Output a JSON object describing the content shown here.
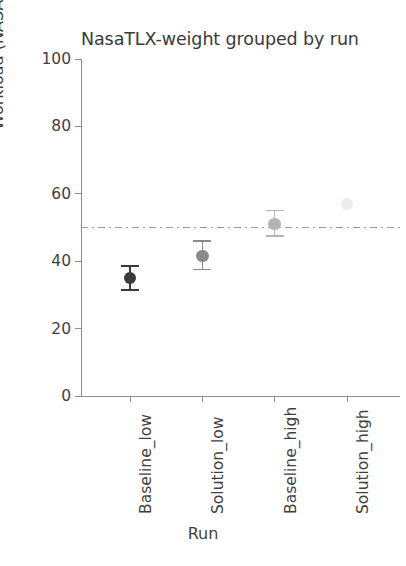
{
  "chart_data": {
    "type": "scatter",
    "title": "NasaTLX-weight grouped by run",
    "xlabel": "Run",
    "ylabel": "Workload (NASA-TLX)",
    "categories": [
      "Baseline_low",
      "Solution_low",
      "Baseline_high",
      "Solution_high"
    ],
    "values": [
      35,
      41.5,
      51,
      57
    ],
    "error_low": [
      31.5,
      37.5,
      47.5,
      57
    ],
    "error_high": [
      38.5,
      46,
      55,
      57
    ],
    "ylim": [
      0,
      100
    ],
    "yticks": [
      0,
      20,
      40,
      60,
      80,
      100
    ],
    "ytick_labels": [
      "0",
      "20",
      "40",
      "60",
      "80",
      "100"
    ],
    "grid": false,
    "legend": "none",
    "reference_line": {
      "value": 50,
      "style": "dash-dot",
      "color": "#9a9a9a"
    },
    "series": [
      {
        "name": "Baseline_low",
        "x": 0,
        "value": 35,
        "error_low": 31.5,
        "error_high": 38.5,
        "color": "#3a3a3a",
        "has_error_bar": true
      },
      {
        "name": "Solution_low",
        "x": 1,
        "value": 41.5,
        "error_low": 37.5,
        "error_high": 46,
        "color": "#8a8a8a",
        "has_error_bar": true
      },
      {
        "name": "Baseline_high",
        "x": 2,
        "value": 51,
        "error_low": 47.5,
        "error_high": 55,
        "color": "#b4b4b4",
        "has_error_bar": true
      },
      {
        "name": "Solution_high",
        "x": 3,
        "value": 57,
        "error_low": 57,
        "error_high": 57,
        "color": "#ececec",
        "has_error_bar": false
      }
    ],
    "axis_color": "#8d8d8d",
    "text_color": "#3f3f3f"
  }
}
